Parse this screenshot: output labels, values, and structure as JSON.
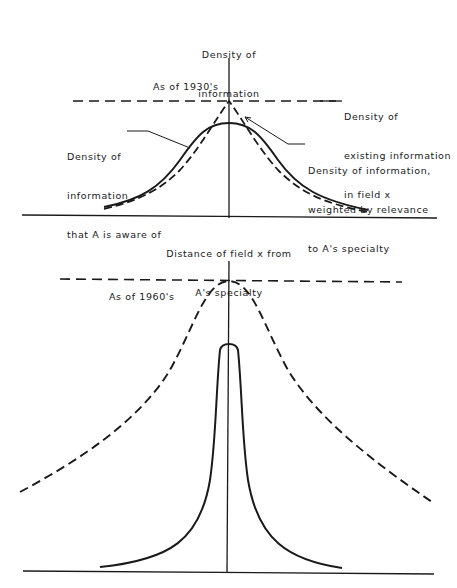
{
  "top_panel": {
    "y_axis_label": [
      "Density of",
      "information"
    ],
    "era_label": "As of 1930's",
    "existing_label": [
      "Density of",
      "existing information",
      "in field x"
    ],
    "aware_label": [
      "Density of",
      "information",
      "that A is aware of"
    ],
    "weighted_label": [
      "Density of information,",
      "weighted by relevance",
      "to A's specialty"
    ],
    "x_axis_label": [
      "Distance of field x from",
      "A's specialty"
    ]
  },
  "bottom_panel": {
    "era_label": "As of 1960's"
  },
  "colors": {
    "ink": "#1a1a1a",
    "background": "#ffffff"
  },
  "legend": {
    "dashed_horizontal": "Density of existing information in field x",
    "dashed_curve": "Density of information weighted by relevance to A's specialty",
    "solid_curve": "Density of information that A is aware of"
  }
}
